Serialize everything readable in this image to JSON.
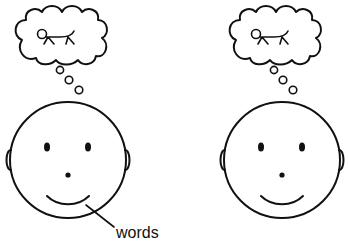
{
  "diagram": {
    "type": "speech-circuit",
    "figures": [
      {
        "id": "speaker",
        "has_thought_bubble": true,
        "thought_content": "concept-sketch-icon",
        "expression": "smiling"
      },
      {
        "id": "listener",
        "has_thought_bubble": true,
        "thought_content": "concept-sketch-icon",
        "expression": "smiling"
      }
    ],
    "annotations": [
      {
        "target": "speaker-mouth",
        "label": "words"
      }
    ]
  },
  "labels": {
    "words": "words"
  },
  "colors": {
    "ink": "#111111",
    "background": "#ffffff"
  }
}
